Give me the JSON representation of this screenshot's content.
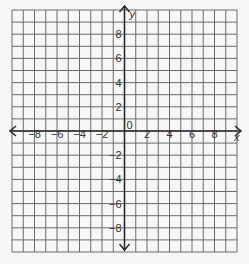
{
  "chart_data": {
    "type": "coordinate-grid",
    "title": "",
    "xlabel": "x",
    "ylabel": "y",
    "xlim": [
      -10,
      10
    ],
    "ylim": [
      -10,
      10
    ],
    "grid": true,
    "grid_step": 1,
    "x_tick_labels": [
      "-8",
      "-6",
      "-4",
      "-2",
      "2",
      "4",
      "6",
      "8"
    ],
    "x_tick_values": [
      -8,
      -6,
      -4,
      -2,
      2,
      4,
      6,
      8
    ],
    "y_tick_labels": [
      "8",
      "6",
      "4",
      "2",
      "-2",
      "-4",
      "-6",
      "-8"
    ],
    "y_tick_values": [
      8,
      6,
      4,
      2,
      -2,
      -4,
      -6,
      -8
    ],
    "origin_label": "0",
    "arrows": [
      "left",
      "right",
      "up",
      "down"
    ]
  },
  "colors": {
    "background": "#f7f7f7",
    "grid_line": "#6b6b6b",
    "axis": "#2a2a2a",
    "text": "#333333"
  }
}
